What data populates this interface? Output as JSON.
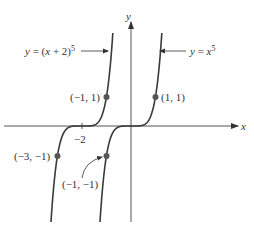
{
  "axes": {
    "x_label": "x",
    "y_label": "y",
    "tick_label_neg2": "−2"
  },
  "curves": [
    {
      "name": "y = (x + 2)^5",
      "label_main": "y = (x + 2)",
      "label_exp": "5"
    },
    {
      "name": "y = x^5",
      "label_main": "y = x",
      "label_exp": "5"
    }
  ],
  "points": [
    {
      "label": "(−1, 1)",
      "x": -1,
      "y": 1
    },
    {
      "label": "(1, 1)",
      "x": 1,
      "y": 1
    },
    {
      "label": "(−3, −1)",
      "x": -3,
      "y": -1
    },
    {
      "label": "(−1, −1)",
      "x": -1,
      "y": -1
    }
  ],
  "colors": {
    "curve": "#3a3a3a",
    "axis": "#555555",
    "dot": "#555555",
    "text": "#333333"
  }
}
